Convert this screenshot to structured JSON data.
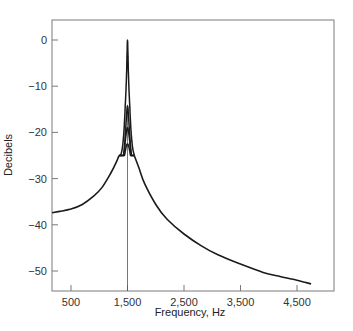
{
  "chart_data": {
    "type": "line",
    "title": "",
    "xlabel": "Frequency, Hz",
    "ylabel": "Decibels",
    "xlim": [
      165,
      4890
    ],
    "ylim": [
      -54.5,
      4.3
    ],
    "grid": false,
    "legend": "none",
    "x_ticks": [
      500,
      1500,
      2500,
      3500,
      4500
    ],
    "x_tick_labels": [
      "500",
      "1,500",
      "2,500",
      "3,500",
      "4,500"
    ],
    "y_ticks": [
      0,
      -10,
      -20,
      -30,
      -40,
      -50
    ],
    "y_tick_labels": [
      "0",
      "−10",
      "−20",
      "−30",
      "−40",
      "−50"
    ],
    "annotations": [
      {
        "type": "vertical-line",
        "x": 1500,
        "label": ""
      }
    ],
    "shared_tail": {
      "x": [
        165,
        300,
        500,
        700,
        900,
        1050,
        1200,
        1300,
        1350,
        1620,
        1700,
        1800,
        2000,
        2200,
        2500,
        2800,
        3100,
        3500,
        3900,
        4200,
        4500,
        4750
      ],
      "values": [
        -37.4,
        -37.1,
        -36.6,
        -35.6,
        -33.8,
        -31.9,
        -28.9,
        -26.5,
        -25.0,
        -25.0,
        -27.6,
        -31.0,
        -35.6,
        -38.8,
        -42.0,
        -44.5,
        -46.5,
        -48.5,
        -50.3,
        -51.2,
        -52.0,
        -52.8
      ]
    },
    "series": [
      {
        "name": "Resonance 1 (sharpest)",
        "peak_x": 1500,
        "peak_db": 0.0
      },
      {
        "name": "Resonance 2",
        "peak_x": 1500,
        "peak_db": -14.3
      },
      {
        "name": "Resonance 3",
        "peak_x": 1500,
        "peak_db": -19.0
      },
      {
        "name": "Resonance 4 (broadest)",
        "peak_x": 1500,
        "peak_db": -22.5
      }
    ]
  }
}
